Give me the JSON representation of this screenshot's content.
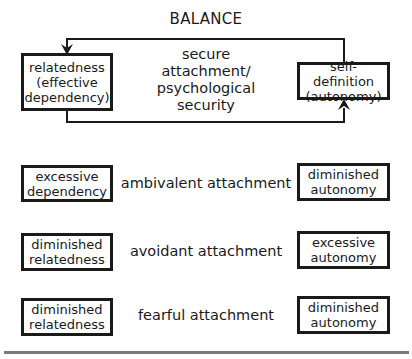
{
  "diagram": {
    "title": "BALANCE",
    "secure": {
      "left_box": {
        "line1": "relatedness",
        "line2": "(effective",
        "line3": "dependency)"
      },
      "center_text": {
        "line1": "secure",
        "line2": "attachment/",
        "line3": "psychological",
        "line4": "security"
      },
      "right_box": {
        "line1": "self-definition",
        "line2": "(autonomy)"
      }
    },
    "rows": [
      {
        "left_box": {
          "line1": "excessive",
          "line2": "dependency"
        },
        "label": "ambivalent attachment",
        "right_box": {
          "line1": "diminished",
          "line2": "autonomy"
        }
      },
      {
        "left_box": {
          "line1": "diminished",
          "line2": "relatedness"
        },
        "label": "avoidant attachment",
        "right_box": {
          "line1": "excessive",
          "line2": "autonomy"
        }
      },
      {
        "left_box": {
          "line1": "diminished",
          "line2": "relatedness"
        },
        "label": "fearful attachment",
        "right_box": {
          "line1": "diminished",
          "line2": "autonomy"
        }
      }
    ],
    "colors": {
      "ink": "#1a1a1a",
      "rule": "#7a7a7a",
      "background": "#ffffff"
    }
  }
}
